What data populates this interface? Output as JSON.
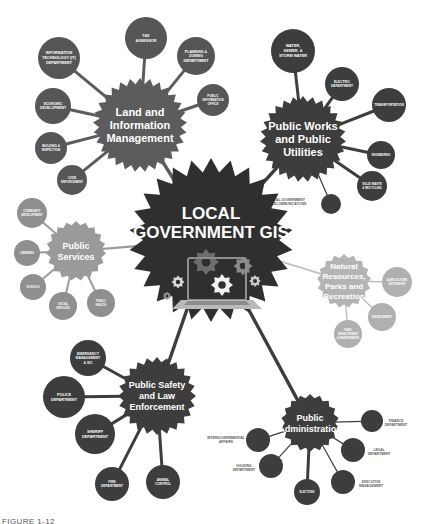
{
  "diagram": {
    "title_lines": [
      "LOCAL",
      "GOVERNMENT GIS"
    ],
    "center_icon": "laptop-with-gears-icon",
    "bottom_caption": "FIGURE 1-12",
    "colors": {
      "center_hub": "#2f2f2f",
      "cluster_dark": "#3d3d3d",
      "cluster_mid": "#5c5c5c",
      "cluster_light": "#9a9a9a",
      "cluster_pale": "#b4b4b4",
      "satellite_dark": "#3d3d3d",
      "satellite_mid": "#585858",
      "label_light": "#ffffff",
      "label_dark": "#5b5b5b",
      "background": "#ffffff"
    },
    "clusters": [
      {
        "id": "land-and-information-management",
        "label": "Land and Information Management",
        "label_lines": [
          "Land and",
          "Information",
          "Management"
        ],
        "tone": "mid",
        "cx": 140,
        "cy": 125,
        "r": 47,
        "satellites": [
          {
            "label": "INFORMATION TECHNOLOGY (IT) DEPARTMENT",
            "label_lines": [
              "INFORMATION",
              "TECHNOLOGY (IT)",
              "DEPARTMENT"
            ],
            "cx": 59,
            "cy": 58,
            "r": 21,
            "inside": true
          },
          {
            "label": "TAX ASSESSOR",
            "label_lines": [
              "TAX",
              "ASSESSOR"
            ],
            "cx": 146,
            "cy": 38,
            "r": 21,
            "inside": true
          },
          {
            "label": "PLANNING & ZONING DEPARTMENT",
            "label_lines": [
              "PLANNING &",
              "ZONING",
              "DEPARTMENT"
            ],
            "cx": 196,
            "cy": 56,
            "r": 19,
            "inside": true
          },
          {
            "label": "PUBLIC INFORMATION OFFICE",
            "label_lines": [
              "PUBLIC",
              "INFORMATION",
              "OFFICE"
            ],
            "cx": 213,
            "cy": 100,
            "r": 16,
            "inside": true
          },
          {
            "label": "ECONOMIC DEVELOPMENT",
            "label_lines": [
              "ECONOMIC",
              "DEVELOPMENT"
            ],
            "cx": 53,
            "cy": 106,
            "r": 18,
            "inside": true
          },
          {
            "label": "BUILDING & INSPECTION",
            "label_lines": [
              "BUILDING &",
              "INSPECTION"
            ],
            "cx": 51,
            "cy": 148,
            "r": 16,
            "inside": true
          },
          {
            "label": "CODE ENFORCEMENT",
            "label_lines": [
              "CODE",
              "ENFORCEMENT"
            ],
            "cx": 72,
            "cy": 180,
            "r": 15,
            "inside": true
          }
        ]
      },
      {
        "id": "public-works-and-public-utilities",
        "label": "Public Works and Public Utilities",
        "label_lines": [
          "Public Works",
          "and Public",
          "Utilities"
        ],
        "tone": "dark",
        "cx": 303,
        "cy": 139,
        "r": 43,
        "satellites": [
          {
            "label": "WATER, SEWER, & STORM WATER",
            "label_lines": [
              "WATER,",
              "SEWER, &",
              "STORM WATER"
            ],
            "cx": 293,
            "cy": 51,
            "r": 22,
            "inside": true
          },
          {
            "label": "ELECTRIC DEPARTMENT",
            "label_lines": [
              "ELECTRIC",
              "DEPARTMENT"
            ],
            "cx": 342,
            "cy": 84,
            "r": 17,
            "inside": true
          },
          {
            "label": "TRANSPORTATION",
            "label_lines": [
              "TRANSPORTATION"
            ],
            "cx": 389,
            "cy": 105,
            "r": 17,
            "inside": true
          },
          {
            "label": "ENGINEERING",
            "label_lines": [
              "ENGINEERING"
            ],
            "cx": 381,
            "cy": 155,
            "r": 14,
            "inside": true
          },
          {
            "label": "SOLID WASTE & RECYCLING",
            "label_lines": [
              "SOLID WASTE",
              "& RECYCLING",
              ""
            ],
            "cx": 372,
            "cy": 186,
            "r": 15,
            "inside": true
          },
          {
            "label": "LOCAL GOVERNMENT TELECOMMUNICATIONS",
            "label_lines": [
              "LOCAL GOVERNMENT",
              "TELECOMMUNICATIONS"
            ],
            "cx": 331,
            "cy": 204,
            "r": 10,
            "inside": false,
            "label_dx": -44,
            "label_dy": -2
          }
        ]
      },
      {
        "id": "public-services",
        "label": "Public Services",
        "label_lines": [
          "Public",
          "Services"
        ],
        "tone": "light",
        "cx": 76,
        "cy": 251,
        "r": 30,
        "satellites": [
          {
            "label": "COMMUNITY DEVELOPMENT",
            "label_lines": [
              "COMMUNITY",
              "DEVELOPMENT"
            ],
            "cx": 32,
            "cy": 213,
            "r": 15,
            "inside": true
          },
          {
            "label": "LIBRARIES",
            "label_lines": [
              "LIBRARIES"
            ],
            "cx": 27,
            "cy": 253,
            "r": 13,
            "inside": true
          },
          {
            "label": "SCHOOLS",
            "label_lines": [
              "SCHOOLS"
            ],
            "cx": 33,
            "cy": 287,
            "r": 13,
            "inside": true
          },
          {
            "label": "SOCIAL SERVICES",
            "label_lines": [
              "SOCIAL",
              "SERVICES"
            ],
            "cx": 63,
            "cy": 306,
            "r": 14,
            "inside": true
          },
          {
            "label": "PUBLIC HEALTH",
            "label_lines": [
              "PUBLIC",
              "HEALTH"
            ],
            "cx": 101,
            "cy": 303,
            "r": 14,
            "inside": true
          }
        ]
      },
      {
        "id": "natural-resources-parks-and-recreation",
        "label": "Natural Resources, Parks and Recreation",
        "label_lines": [
          "Natural",
          "Resources,",
          "Parks and",
          "Recreation"
        ],
        "tone": "pale",
        "cx": 344,
        "cy": 281,
        "r": 27,
        "satellites": [
          {
            "label": "AGRICULTURE EXTENSION",
            "label_lines": [
              "AGRICULTURE",
              "EXTENSION"
            ],
            "cx": 397,
            "cy": 282,
            "r": 15,
            "inside": true
          },
          {
            "label": "ENVIRONMENT",
            "label_lines": [
              "ENVIRONMENT"
            ],
            "cx": 382,
            "cy": 317,
            "r": 14,
            "inside": true
          },
          {
            "label": "PARK DEVELOPMENT & MAINTENANCE",
            "label_lines": [
              "PARK",
              "DEVELOPMENT",
              "& MAINTENANCE"
            ],
            "cx": 348,
            "cy": 334,
            "r": 14,
            "inside": true
          }
        ]
      },
      {
        "id": "public-safety-and-law-enforcement",
        "label": "Public Safety and Law Enforcement",
        "label_lines": [
          "Public Safety",
          "and Law",
          "Enforcement"
        ],
        "tone": "dark",
        "cx": 157,
        "cy": 396,
        "r": 39,
        "satellites": [
          {
            "label": "EMERGENCY MANAGEMENT & 911",
            "label_lines": [
              "EMERGENCY",
              "MANAGEMENT",
              "& 911"
            ],
            "cx": 88,
            "cy": 358,
            "r": 18,
            "inside": true
          },
          {
            "label": "POLICE DEPARTMENT",
            "label_lines": [
              "POLICE",
              "DEPARTMENT"
            ],
            "cx": 64,
            "cy": 397,
            "r": 21,
            "inside": true
          },
          {
            "label": "SHERIFF DEPARTMENT",
            "label_lines": [
              "SHERIFF",
              "DEPARTMENT"
            ],
            "cx": 95,
            "cy": 434,
            "r": 20,
            "inside": true
          },
          {
            "label": "FIRE DEPARTMENT",
            "label_lines": [
              "FIRE",
              "DEPARTMENT"
            ],
            "cx": 112,
            "cy": 484,
            "r": 17,
            "inside": true
          },
          {
            "label": "ANIMAL CONTROL",
            "label_lines": [
              "ANIMAL",
              "CONTROL"
            ],
            "cx": 163,
            "cy": 482,
            "r": 17,
            "inside": true
          }
        ]
      },
      {
        "id": "public-administration",
        "label": "Public Administration",
        "label_lines": [
          "Public",
          "Administration"
        ],
        "tone": "dark",
        "cx": 310,
        "cy": 423,
        "r": 29,
        "satellites": [
          {
            "label": "FINANCE DEPARTMENT",
            "label_lines": [
              "FINANCE",
              "DEPARTMENT"
            ],
            "cx": 372,
            "cy": 421,
            "r": 11,
            "inside": false,
            "label_dx": 24,
            "label_dy": 2
          },
          {
            "label": "LEGAL DEPARTMENT",
            "label_lines": [
              "LEGAL",
              "DEPARTMENT"
            ],
            "cx": 353,
            "cy": 450,
            "r": 12,
            "inside": false,
            "label_dx": 26,
            "label_dy": 2
          },
          {
            "label": "EXECUTIVE MANAGEMENT",
            "label_lines": [
              "EXECUTIVE",
              "MANAGEMENT"
            ],
            "cx": 343,
            "cy": 482,
            "r": 12,
            "inside": false,
            "label_dx": 28,
            "label_dy": 2
          },
          {
            "label": "ELECTIONS",
            "label_lines": [
              "ELECTIONS"
            ],
            "cx": 307,
            "cy": 492,
            "r": 13,
            "inside": true
          },
          {
            "label": "HOUSING DEPARTMENT",
            "label_lines": [
              "HOUSING",
              "DEPARTMENT"
            ],
            "cx": 271,
            "cy": 466,
            "r": 12,
            "inside": false,
            "label_dx": -27,
            "label_dy": 2
          },
          {
            "label": "INTERGOVERNMENTAL AFFAIRS",
            "label_lines": [
              "INTERGOVERNMENTAL",
              "AFFAIRS"
            ],
            "cx": 258,
            "cy": 440,
            "r": 12,
            "inside": false,
            "label_dx": -32,
            "label_dy": 0
          }
        ]
      }
    ]
  }
}
